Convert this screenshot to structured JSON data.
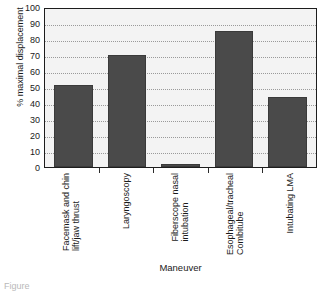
{
  "chart_data": {
    "type": "bar",
    "title": "",
    "subtitle": "",
    "xlabel": "Maneuver",
    "ylabel": "% maximal displacement",
    "categories": [
      "Facemask and chin\nlift/jaw thrust",
      "Laryngoscopy",
      "Fiberscope nasal\nintubation",
      "Esophageal/tracheal\nCombitube",
      "Intubating LMA"
    ],
    "values": [
      51,
      70,
      2,
      85,
      44
    ],
    "ylim": [
      0,
      100
    ],
    "yticks": [
      0,
      10,
      20,
      30,
      40,
      50,
      60,
      70,
      80,
      90,
      100
    ],
    "ytick_labels": [
      "0",
      "10",
      "20",
      "30",
      "40",
      "50",
      "60",
      "70",
      "80",
      "90",
      "100"
    ],
    "grid": true,
    "grid_axis": "y",
    "grid_style": "dotted",
    "legend": false,
    "legend_position": "none",
    "bar_color": "#4a4a4a",
    "plot_background": "#f3f3f3",
    "frame_color": "#1d1d1d",
    "gridline_color": "#9a9a9a"
  },
  "caption": {
    "text": "Figure"
  }
}
